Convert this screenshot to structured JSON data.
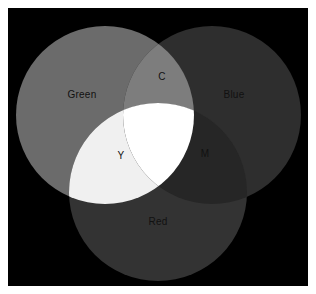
{
  "figure": {
    "title": "",
    "background_color": "#ffffff",
    "plot_background_color": "#000000",
    "width": 316,
    "height": 294,
    "margin_left": 8,
    "margin_top": 8
  },
  "chart_data": {
    "type": "diagram",
    "diagram_type": "venn",
    "title": "",
    "subtitle": "",
    "xlabel": "",
    "ylabel": "",
    "grid": false,
    "legend_position": "none",
    "sets": [
      {
        "id": "green",
        "label": "Green",
        "cx": 97,
        "cy": 107,
        "r": 89,
        "fill": "#6b6b6b",
        "label_x": 74,
        "label_y": 87,
        "label_color": "#111111"
      },
      {
        "id": "blue",
        "label": "Blue",
        "cx": 204,
        "cy": 107,
        "r": 89,
        "fill": "#2e2e2e",
        "label_x": 226,
        "label_y": 87,
        "label_color": "#111111"
      },
      {
        "id": "red",
        "label": "Red",
        "cx": 150,
        "cy": 184,
        "r": 89,
        "fill": "#333333",
        "label_x": 150,
        "label_y": 214,
        "label_color": "#111111"
      }
    ],
    "intersections": [
      {
        "id": "cyan",
        "label": "C",
        "sets": [
          "green",
          "blue"
        ],
        "fill": "#7d7d7d",
        "label_x": 154,
        "label_y": 69,
        "label_color": "#111111"
      },
      {
        "id": "yellow",
        "label": "Y",
        "sets": [
          "green",
          "red"
        ],
        "fill": "#f0f0f0",
        "label_x": 113,
        "label_y": 148,
        "label_color": "#111111"
      },
      {
        "id": "magenta",
        "label": "M",
        "sets": [
          "blue",
          "red"
        ],
        "fill": "#262626",
        "label_x": 197,
        "label_y": 146,
        "label_color": "#111111"
      },
      {
        "id": "white",
        "label": "",
        "sets": [
          "green",
          "blue",
          "red"
        ],
        "fill": "#ffffff",
        "label_x": 150,
        "label_y": 124,
        "label_color": "#111111"
      }
    ],
    "labels": [
      "Green",
      "Blue",
      "Red",
      "C",
      "Y",
      "M"
    ]
  }
}
